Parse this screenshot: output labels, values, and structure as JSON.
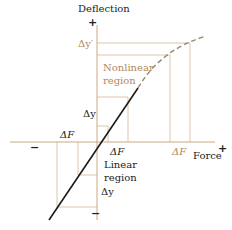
{
  "axes": {
    "y_label": "Deflection",
    "x_label": "Force",
    "y_plus": "+",
    "y_minus": "−",
    "x_plus": "+",
    "x_minus": "−"
  },
  "regions": {
    "nonlinear": [
      "Nonlinear",
      "region"
    ],
    "linear": [
      "Linear",
      "region"
    ]
  },
  "labels": {
    "delta_y_prime": "Δy′",
    "delta_y_upper": "Δy",
    "delta_y_lower": "Δy",
    "delta_f_left": "ΔF",
    "delta_f_center": "ΔF",
    "delta_f_right": "ΔF"
  },
  "colors": {
    "axis": "#c8a882",
    "guide": "#c8a882",
    "linear_curve": "#1a1a1a",
    "nonlinear_curve": "#9a8670",
    "text_dark": "#222222",
    "text_tan": "#b08a5e"
  }
}
